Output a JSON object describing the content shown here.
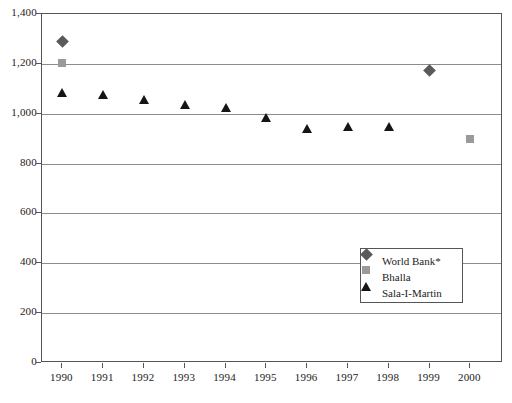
{
  "chart_data": {
    "type": "scatter",
    "title": "",
    "xlabel": "",
    "ylabel": "",
    "categories": [
      "1990",
      "1991",
      "1992",
      "1993",
      "1994",
      "1995",
      "1996",
      "1997",
      "1998",
      "1999",
      "2000"
    ],
    "x": [
      1990,
      1991,
      1992,
      1993,
      1994,
      1995,
      1996,
      1997,
      1998,
      1999,
      2000
    ],
    "xlim": [
      1989.5,
      2000.8
    ],
    "ylim": [
      0,
      1400
    ],
    "y_ticks": [
      0,
      200,
      400,
      600,
      800,
      1000,
      1200,
      1400
    ],
    "y_tick_labels": [
      "0",
      "200",
      "400",
      "600",
      "800",
      "1,000",
      "1,200",
      "1,400"
    ],
    "grid": true,
    "grid_axis": "y",
    "legend_position": "inside-lower-right",
    "series": [
      {
        "name": "World Bank*",
        "marker": "diamond",
        "color": "#5a5a5a",
        "points": [
          {
            "x": 1990,
            "y": 1290
          },
          {
            "x": 1999,
            "y": 1172
          }
        ]
      },
      {
        "name": "Bhalla",
        "marker": "square",
        "color": "#9a9a9a",
        "points": [
          {
            "x": 1990,
            "y": 1205
          },
          {
            "x": 2000,
            "y": 898
          }
        ]
      },
      {
        "name": "Sala-I-Martin",
        "marker": "triangle",
        "color": "#151515",
        "points": [
          {
            "x": 1990,
            "y": 1086
          },
          {
            "x": 1991,
            "y": 1076
          },
          {
            "x": 1992,
            "y": 1058
          },
          {
            "x": 1993,
            "y": 1036
          },
          {
            "x": 1994,
            "y": 1026
          },
          {
            "x": 1995,
            "y": 984
          },
          {
            "x": 1996,
            "y": 940
          },
          {
            "x": 1997,
            "y": 950
          },
          {
            "x": 1998,
            "y": 948
          }
        ]
      }
    ]
  },
  "legend": {
    "items": [
      {
        "label": "World Bank*",
        "marker": "diamond"
      },
      {
        "label": "Bhalla",
        "marker": "square"
      },
      {
        "label": "Sala-I-Martin",
        "marker": "triangle"
      }
    ]
  }
}
